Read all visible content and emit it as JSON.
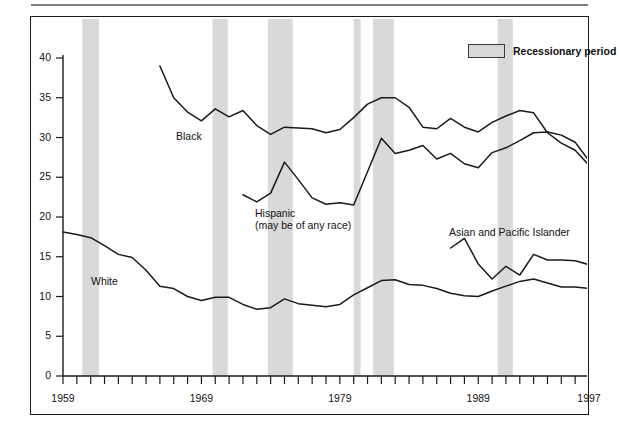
{
  "legend": {
    "swatch_color": "#d9d9d9",
    "label": "Recessionary period"
  },
  "axes": {
    "y_ticks": [
      "40",
      "35",
      "30",
      "25",
      "20",
      "15",
      "10",
      "5",
      "0"
    ],
    "x_ticks": [
      "1959",
      "1969",
      "1979",
      "1989",
      "1997"
    ]
  },
  "series_labels": {
    "black": "Black",
    "hispanic_line1": "Hispanic",
    "hispanic_line2": "(may be of any race)",
    "white": "White",
    "asian": "Asian and Pacific Islander"
  },
  "chart_data": {
    "type": "line",
    "title": "",
    "xlabel": "",
    "ylabel": "",
    "xlim": [
      1959,
      1997
    ],
    "ylim": [
      0,
      40
    ],
    "y_ticks": [
      0,
      5,
      10,
      15,
      20,
      25,
      30,
      35,
      40
    ],
    "x_ticks_labeled": [
      1959,
      1969,
      1979,
      1989,
      1997
    ],
    "x_tick_interval": 1,
    "grid": false,
    "legend_position": "top-right",
    "line_color": "#1a1a1a",
    "band_color": "#d9d9d9",
    "recession_bands": [
      {
        "start": 1960.4,
        "end": 1961.6
      },
      {
        "start": 1969.8,
        "end": 1970.9
      },
      {
        "start": 1973.8,
        "end": 1975.6
      },
      {
        "start": 1980.0,
        "end": 1980.5
      },
      {
        "start": 1981.4,
        "end": 1982.9
      },
      {
        "start": 1990.4,
        "end": 1991.5
      }
    ],
    "series": [
      {
        "name": "Black",
        "x": [
          1966,
          1967,
          1968,
          1969,
          1970,
          1971,
          1972,
          1973,
          1974,
          1975,
          1976,
          1977,
          1978,
          1979,
          1980,
          1981,
          1982,
          1983,
          1984,
          1985,
          1986,
          1987,
          1988,
          1989,
          1990,
          1991,
          1992,
          1993,
          1994,
          1995,
          1996,
          1997
        ],
        "values": [
          39.0,
          35.0,
          33.2,
          32.1,
          33.6,
          32.6,
          33.4,
          31.5,
          30.4,
          31.3,
          31.2,
          31.1,
          30.6,
          31.0,
          32.5,
          34.2,
          35.0,
          35.0,
          33.8,
          31.3,
          31.1,
          32.4,
          31.3,
          30.7,
          31.9,
          32.7,
          33.4,
          33.1,
          30.6,
          29.3,
          28.4,
          26.5
        ]
      },
      {
        "name": "Hispanic (may be of any race)",
        "x": [
          1972,
          1973,
          1974,
          1975,
          1976,
          1977,
          1978,
          1979,
          1980,
          1981,
          1982,
          1983,
          1984,
          1985,
          1986,
          1987,
          1988,
          1989,
          1990,
          1991,
          1992,
          1993,
          1994,
          1995,
          1996,
          1997
        ],
        "values": [
          22.8,
          21.9,
          23.0,
          26.9,
          24.7,
          22.4,
          21.6,
          21.8,
          21.5,
          25.7,
          29.9,
          28.0,
          28.4,
          29.0,
          27.3,
          28.0,
          26.7,
          26.2,
          28.1,
          28.7,
          29.6,
          30.6,
          30.7,
          30.3,
          29.4,
          27.1
        ]
      },
      {
        "name": "White",
        "x": [
          1959,
          1960,
          1961,
          1962,
          1963,
          1964,
          1965,
          1966,
          1967,
          1968,
          1969,
          1970,
          1971,
          1972,
          1973,
          1974,
          1975,
          1976,
          1977,
          1978,
          1979,
          1980,
          1981,
          1982,
          1983,
          1984,
          1985,
          1986,
          1987,
          1988,
          1989,
          1990,
          1991,
          1992,
          1993,
          1994,
          1995,
          1996,
          1997
        ],
        "values": [
          18.1,
          17.8,
          17.4,
          16.4,
          15.3,
          14.9,
          13.3,
          11.3,
          11.0,
          10.0,
          9.5,
          9.9,
          9.9,
          9.0,
          8.4,
          8.6,
          9.7,
          9.1,
          8.9,
          8.7,
          9.0,
          10.2,
          11.1,
          12.0,
          12.1,
          11.5,
          11.4,
          11.0,
          10.4,
          10.1,
          10.0,
          10.7,
          11.3,
          11.9,
          12.2,
          11.7,
          11.2,
          11.2,
          11.0
        ]
      },
      {
        "name": "Asian and Pacific Islander",
        "x": [
          1987,
          1988,
          1989,
          1990,
          1991,
          1992,
          1993,
          1994,
          1995,
          1996,
          1997
        ],
        "values": [
          16.1,
          17.3,
          14.1,
          12.2,
          13.8,
          12.7,
          15.3,
          14.6,
          14.6,
          14.5,
          14.0
        ]
      }
    ]
  }
}
